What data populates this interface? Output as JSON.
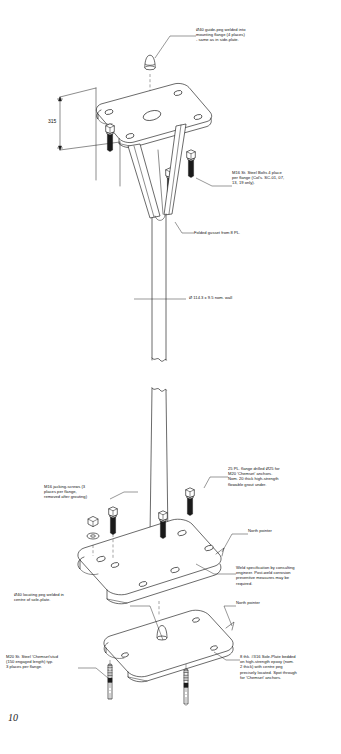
{
  "sheet": {
    "page_number": "10",
    "background_color": "#ffffff",
    "line_color": "#1a1a1a",
    "fill_color": "#ffffff",
    "bolt_fill": "#1a1a1a",
    "drawing_type": "isometric exploded assembly"
  },
  "dimensions": [
    {
      "id": "overall-height",
      "label": "315"
    }
  ],
  "notes": [
    {
      "id": "guide-peg",
      "text": "Ø40 guide-peg welded into\nmounting flange (4 places)\n- same as in side-plate."
    },
    {
      "id": "bolts",
      "text": "M16 St. Steel Bolts 4 place\nper flange (Col's. SC-01, 07,\n13, 19 only)."
    },
    {
      "id": "gusset",
      "text": "Folded gusset from 8 PL."
    },
    {
      "id": "pipe-size",
      "text": "Ø 114.3 x 9.5 nom. wall"
    },
    {
      "id": "base-flange",
      "text": "25 PL. flange drilled Ø25 for\nM20 'Chemset' anchors.\nNom. 20 thick high-strength\nflowable grout under."
    },
    {
      "id": "jacking-screws",
      "text": "M16 jacking-screws (3\nplaces per flange,\nremoved after grouting)"
    },
    {
      "id": "north-pointer-upper",
      "text": "North pointer"
    },
    {
      "id": "weld-spec",
      "text": "Weld specification by consulting\nengineer. Post-weld corrosion\npreventive measures may be\nrequired."
    },
    {
      "id": "locating-peg",
      "text": "Ø40 locating peg welded in\ncentre of sole-plate."
    },
    {
      "id": "north-pointer-lower",
      "text": "North pointer"
    },
    {
      "id": "sole-plate",
      "text": "8 thk. #316  Sole-Plate bedded\non high-strength epoxy (nom.\n2 thick) with centre peg\nprecisely located.  Spot through\nfor 'Chemset' anchors."
    },
    {
      "id": "chemset-stud",
      "text": "M20 St. Steel 'Chemset'stud\n(150 engaged length) typ.\n3 places per flange."
    }
  ]
}
